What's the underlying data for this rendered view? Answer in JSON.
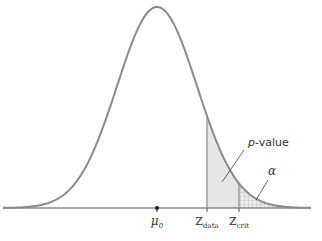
{
  "diagram": {
    "type": "normal-distribution-hypothesis-test",
    "colors": {
      "curve": "#8a8a8a",
      "axis": "#555555",
      "pvalue_fill": "#e6e6e6",
      "alpha_grid": "#a8a8a8",
      "text": "#333333"
    },
    "labels": {
      "mu": "μ",
      "mu_sub": "0",
      "z": "Z",
      "z_data_sub": "data",
      "z_crit_sub": "crit",
      "p_italic": "p",
      "p_rest": "-value",
      "alpha": "α"
    }
  },
  "chart_data": {
    "type": "area",
    "title": "",
    "curve": "normal density",
    "mean_px": 157,
    "sigma_px": 40,
    "baseline_y_px": 208,
    "peak_y_px": 7,
    "x_range_px": [
      3,
      311
    ],
    "markers": [
      {
        "name": "mu_0",
        "x_px": 157
      },
      {
        "name": "Z_data",
        "x_px": 207
      },
      {
        "name": "Z_crit",
        "x_px": 239
      }
    ],
    "regions": [
      {
        "name": "p-value",
        "from": "Z_data",
        "to": "right tail",
        "fill": "light gray shading"
      },
      {
        "name": "alpha",
        "from": "Z_crit",
        "to": "right tail",
        "fill": "cross-hatch grid"
      }
    ],
    "annotations": [
      {
        "text": "p-value",
        "x_px": 248,
        "y_px": 146,
        "pointer_to": [
          222,
          182
        ]
      },
      {
        "text": "α",
        "x_px": 268,
        "y_px": 175,
        "pointer_to": [
          256,
          200
        ]
      }
    ]
  }
}
